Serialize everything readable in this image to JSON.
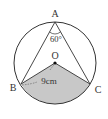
{
  "diagram": {
    "type": "circle-inscribed-angle",
    "circle": {
      "center_label": "O",
      "cx": 55,
      "cy": 63,
      "r": 41
    },
    "points": {
      "A": {
        "label": "A",
        "x": 55,
        "y": 22
      },
      "B": {
        "label": "B",
        "x": 21,
        "y": 84
      },
      "C": {
        "label": "C",
        "x": 90,
        "y": 84
      },
      "O": {
        "label": "O",
        "x": 55,
        "y": 63
      }
    },
    "angle_label": "60°",
    "radius_label": "9cm",
    "shaded_region": "sector OBC",
    "colors": {
      "stroke": "#333333",
      "shade": "#c8c8c8",
      "background": "#ffffff"
    }
  }
}
